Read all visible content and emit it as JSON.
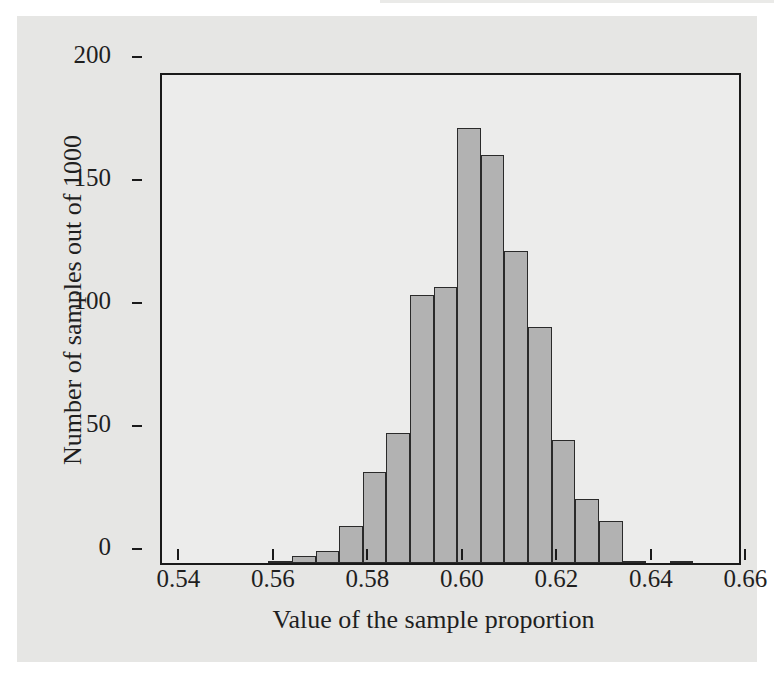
{
  "figure": {
    "background_color": "#e6e6e4",
    "plot_background_color": "#ececeb",
    "axis_color": "#1a1a1a",
    "bar_fill_color": "#b2b2b2",
    "bar_edge_color": "#2a2a2a"
  },
  "chart_data": {
    "type": "bar",
    "title": "",
    "subtitle": "",
    "xlabel": "Value of the sample proportion",
    "ylabel": "Number of samples out of 1000",
    "xlim": [
      0.5325,
      0.6555
    ],
    "ylim": [
      0,
      200
    ],
    "grid": false,
    "legend": null,
    "bin_width": 0.005,
    "x_tick_labels": [
      "0.54",
      "0.56",
      "0.58",
      "0.60",
      "0.62",
      "0.64",
      "0.66"
    ],
    "x_tick_values": [
      0.54,
      0.56,
      0.58,
      0.6,
      0.62,
      0.64,
      0.66
    ],
    "y_tick_labels": [
      "0",
      "50",
      "100",
      "150",
      "200"
    ],
    "y_tick_values": [
      0,
      50,
      100,
      150,
      200
    ],
    "bins": [
      {
        "left": 0.555,
        "right": 0.56,
        "center": 0.5575,
        "count": 1
      },
      {
        "left": 0.56,
        "right": 0.565,
        "center": 0.5625,
        "count": 3
      },
      {
        "left": 0.565,
        "right": 0.57,
        "center": 0.5675,
        "count": 5
      },
      {
        "left": 0.57,
        "right": 0.575,
        "center": 0.5725,
        "count": 15
      },
      {
        "left": 0.575,
        "right": 0.58,
        "center": 0.5775,
        "count": 37
      },
      {
        "left": 0.58,
        "right": 0.585,
        "center": 0.5825,
        "count": 53
      },
      {
        "left": 0.585,
        "right": 0.59,
        "center": 0.5875,
        "count": 109
      },
      {
        "left": 0.59,
        "right": 0.595,
        "center": 0.5925,
        "count": 112
      },
      {
        "left": 0.595,
        "right": 0.6,
        "center": 0.5975,
        "count": 177
      },
      {
        "left": 0.6,
        "right": 0.605,
        "center": 0.6025,
        "count": 166
      },
      {
        "left": 0.605,
        "right": 0.61,
        "center": 0.6075,
        "count": 127
      },
      {
        "left": 0.61,
        "right": 0.615,
        "center": 0.6125,
        "count": 96
      },
      {
        "left": 0.615,
        "right": 0.62,
        "center": 0.6175,
        "count": 50
      },
      {
        "left": 0.62,
        "right": 0.625,
        "center": 0.6225,
        "count": 26
      },
      {
        "left": 0.625,
        "right": 0.63,
        "center": 0.6275,
        "count": 17
      },
      {
        "left": 0.63,
        "right": 0.635,
        "center": 0.6325,
        "count": 1
      },
      {
        "left": 0.64,
        "right": 0.645,
        "center": 0.6425,
        "count": 1
      }
    ],
    "categories": [
      0.5575,
      0.5625,
      0.5675,
      0.5725,
      0.5775,
      0.5825,
      0.5875,
      0.5925,
      0.5975,
      0.6025,
      0.6075,
      0.6125,
      0.6175,
      0.6225,
      0.6275,
      0.6325,
      0.6425
    ],
    "values": [
      1,
      3,
      5,
      15,
      37,
      53,
      109,
      112,
      177,
      166,
      127,
      96,
      50,
      26,
      17,
      1,
      1
    ]
  }
}
